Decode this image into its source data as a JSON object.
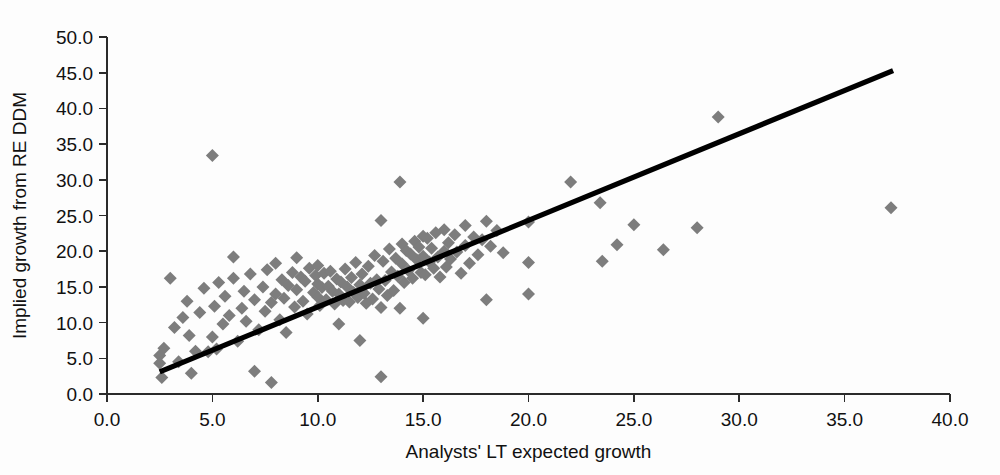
{
  "chart_data": {
    "type": "scatter",
    "title": "",
    "xlabel": "Analysts' LT expected growth",
    "ylabel": "Implied growth from  RE DDM",
    "xlim": [
      0.0,
      40.0
    ],
    "ylim": [
      0.0,
      50.0
    ],
    "xticks": [
      "0.0",
      "5.0",
      "10.0",
      "15.0",
      "20.0",
      "25.0",
      "30.0",
      "35.0",
      "40.0"
    ],
    "yticks": [
      "0.0",
      "5.0",
      "10.0",
      "15.0",
      "20.0",
      "25.0",
      "30.0",
      "35.0",
      "40.0",
      "45.0",
      "50.0"
    ],
    "xtick_values": [
      0,
      5,
      10,
      15,
      20,
      25,
      30,
      35,
      40
    ],
    "ytick_values": [
      0,
      5,
      10,
      15,
      20,
      25,
      30,
      35,
      40,
      45,
      50
    ],
    "grid": false,
    "legend": false,
    "marker_shape": "diamond",
    "marker_color": "#7d7d7d",
    "marker_size": 13,
    "trendline": {
      "color": "#000000",
      "width": 5.2,
      "x_start": 2.5,
      "y_start": 3.1,
      "x_end": 37.3,
      "y_end": 45.3
    },
    "series": [
      {
        "name": "Firms",
        "points": [
          [
            2.5,
            5.4
          ],
          [
            2.5,
            4.3
          ],
          [
            2.6,
            2.3
          ],
          [
            2.7,
            6.4
          ],
          [
            3.0,
            16.2
          ],
          [
            3.2,
            9.3
          ],
          [
            3.4,
            4.5
          ],
          [
            3.6,
            10.7
          ],
          [
            3.8,
            13.0
          ],
          [
            3.9,
            8.2
          ],
          [
            4.0,
            2.9
          ],
          [
            4.2,
            6.0
          ],
          [
            4.4,
            11.4
          ],
          [
            4.6,
            14.8
          ],
          [
            4.8,
            5.9
          ],
          [
            5.0,
            33.4
          ],
          [
            5.0,
            8.0
          ],
          [
            5.1,
            12.3
          ],
          [
            5.2,
            6.3
          ],
          [
            5.3,
            15.6
          ],
          [
            5.5,
            9.8
          ],
          [
            5.6,
            13.7
          ],
          [
            5.8,
            11.0
          ],
          [
            6.0,
            16.2
          ],
          [
            6.0,
            19.2
          ],
          [
            6.2,
            7.4
          ],
          [
            6.4,
            12.0
          ],
          [
            6.5,
            14.4
          ],
          [
            6.6,
            10.2
          ],
          [
            6.8,
            16.8
          ],
          [
            7.0,
            13.2
          ],
          [
            7.0,
            3.2
          ],
          [
            7.2,
            9.0
          ],
          [
            7.4,
            15.0
          ],
          [
            7.5,
            11.6
          ],
          [
            7.6,
            17.4
          ],
          [
            7.8,
            12.8
          ],
          [
            7.8,
            1.6
          ],
          [
            8.0,
            14.0
          ],
          [
            8.0,
            18.3
          ],
          [
            8.2,
            10.4
          ],
          [
            8.3,
            16.0
          ],
          [
            8.4,
            13.4
          ],
          [
            8.5,
            8.6
          ],
          [
            8.6,
            15.2
          ],
          [
            8.8,
            17.0
          ],
          [
            8.9,
            12.2
          ],
          [
            9.0,
            14.6
          ],
          [
            9.0,
            19.1
          ],
          [
            9.2,
            16.4
          ],
          [
            9.3,
            13.0
          ],
          [
            9.4,
            15.8
          ],
          [
            9.5,
            11.2
          ],
          [
            9.6,
            17.6
          ],
          [
            9.8,
            14.2
          ],
          [
            9.9,
            16.6
          ],
          [
            10.0,
            13.6
          ],
          [
            10.0,
            15.4
          ],
          [
            10.0,
            18.0
          ],
          [
            10.1,
            12.4
          ],
          [
            10.2,
            14.9
          ],
          [
            10.3,
            16.9
          ],
          [
            10.4,
            13.2
          ],
          [
            10.5,
            15.1
          ],
          [
            10.6,
            17.2
          ],
          [
            10.7,
            14.4
          ],
          [
            10.8,
            12.6
          ],
          [
            10.9,
            16.1
          ],
          [
            11.0,
            14.0
          ],
          [
            11.0,
            9.8
          ],
          [
            11.1,
            15.7
          ],
          [
            11.2,
            13.1
          ],
          [
            11.3,
            17.5
          ],
          [
            11.4,
            15.0
          ],
          [
            11.5,
            12.9
          ],
          [
            11.6,
            16.3
          ],
          [
            11.7,
            14.2
          ],
          [
            11.8,
            18.4
          ],
          [
            11.9,
            13.5
          ],
          [
            12.0,
            15.3
          ],
          [
            12.0,
            7.5
          ],
          [
            12.1,
            16.8
          ],
          [
            12.2,
            14.1
          ],
          [
            12.3,
            12.7
          ],
          [
            12.4,
            17.9
          ],
          [
            12.5,
            15.5
          ],
          [
            12.6,
            13.3
          ],
          [
            12.7,
            19.4
          ],
          [
            12.8,
            16.0
          ],
          [
            12.9,
            14.7
          ],
          [
            13.0,
            24.3
          ],
          [
            13.0,
            2.4
          ],
          [
            13.0,
            12.1
          ],
          [
            13.1,
            18.6
          ],
          [
            13.2,
            15.9
          ],
          [
            13.3,
            13.8
          ],
          [
            13.4,
            20.3
          ],
          [
            13.5,
            17.1
          ],
          [
            13.6,
            14.5
          ],
          [
            13.7,
            19.0
          ],
          [
            13.8,
            16.5
          ],
          [
            13.9,
            29.7
          ],
          [
            13.9,
            12.0
          ],
          [
            14.0,
            21.0
          ],
          [
            14.0,
            18.2
          ],
          [
            14.1,
            15.6
          ],
          [
            14.2,
            20.1
          ],
          [
            14.3,
            17.3
          ],
          [
            14.4,
            19.6
          ],
          [
            14.5,
            16.2
          ],
          [
            14.6,
            21.4
          ],
          [
            14.7,
            18.8
          ],
          [
            14.8,
            20.6
          ],
          [
            14.9,
            17.0
          ],
          [
            15.0,
            22.1
          ],
          [
            15.0,
            19.3
          ],
          [
            15.0,
            10.6
          ],
          [
            15.1,
            16.7
          ],
          [
            15.2,
            21.8
          ],
          [
            15.3,
            18.5
          ],
          [
            15.4,
            20.4
          ],
          [
            15.5,
            17.6
          ],
          [
            15.6,
            22.6
          ],
          [
            15.7,
            19.2
          ],
          [
            15.8,
            16.4
          ],
          [
            16.0,
            23.0
          ],
          [
            16.0,
            20.0
          ],
          [
            16.1,
            17.8
          ],
          [
            16.2,
            21.2
          ],
          [
            16.3,
            18.9
          ],
          [
            16.5,
            22.3
          ],
          [
            16.6,
            19.9
          ],
          [
            16.8,
            16.9
          ],
          [
            17.0,
            23.6
          ],
          [
            17.0,
            20.8
          ],
          [
            17.2,
            18.3
          ],
          [
            17.4,
            22.0
          ],
          [
            17.6,
            19.5
          ],
          [
            17.8,
            21.6
          ],
          [
            18.0,
            24.2
          ],
          [
            18.0,
            13.2
          ],
          [
            18.2,
            20.7
          ],
          [
            18.5,
            22.9
          ],
          [
            18.8,
            19.8
          ],
          [
            20.0,
            24.1
          ],
          [
            20.0,
            18.4
          ],
          [
            20.0,
            14.0
          ],
          [
            22.0,
            29.7
          ],
          [
            23.4,
            26.8
          ],
          [
            23.5,
            18.6
          ],
          [
            24.2,
            20.9
          ],
          [
            25.0,
            23.7
          ],
          [
            26.4,
            20.2
          ],
          [
            28.0,
            23.3
          ],
          [
            29.0,
            38.8
          ],
          [
            37.2,
            26.1
          ]
        ]
      }
    ]
  },
  "axis": {
    "x_label": "Analysts' LT expected growth",
    "y_label": "Implied growth from  RE DDM"
  }
}
